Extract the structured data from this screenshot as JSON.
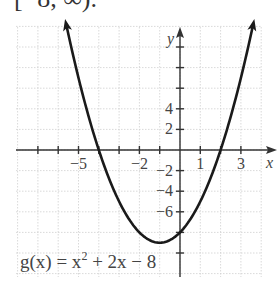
{
  "header": {
    "partial_text": "[−8, ∞)."
  },
  "chart_data": {
    "type": "line",
    "title": "",
    "function_label": "g(x) = x² + 2x − 8",
    "function_label_parts": {
      "prefix": "g(x) = x",
      "exp": "2",
      "suffix": " + 2x − 8"
    },
    "xlabel": "x",
    "ylabel": "y",
    "xlim": [
      -8,
      4
    ],
    "ylim": [
      -12,
      12
    ],
    "x_tick_labels": [
      {
        "value": -5,
        "text": "−5"
      },
      {
        "value": -2,
        "text": "−2"
      },
      {
        "value": 1,
        "text": "1"
      },
      {
        "value": 3,
        "text": "3"
      }
    ],
    "y_tick_labels": [
      {
        "value": 4,
        "text": "4"
      },
      {
        "value": 2,
        "text": "2"
      },
      {
        "value": -2,
        "text": "−2"
      },
      {
        "value": -4,
        "text": "−4"
      },
      {
        "value": -6,
        "text": "−6"
      }
    ],
    "grid": true,
    "series": [
      {
        "name": "g(x)",
        "expression": "x^2 + 2x - 8",
        "x_range": [
          -5.6,
          3.6
        ],
        "vertex": [
          -1,
          -9
        ],
        "roots": [
          -4,
          2
        ],
        "y_intercept": -8,
        "arrows_both_ends": true
      }
    ]
  },
  "style": {
    "axis_color": "#333333",
    "grid_color": "#cfcfcf",
    "curve_color": "#1a1a1a"
  }
}
